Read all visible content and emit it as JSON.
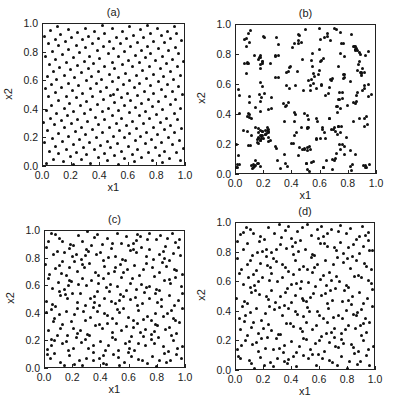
{
  "figure": {
    "panels": [
      {
        "id": "a",
        "title": "(a)",
        "xlabel": "x1",
        "ylabel": "x2",
        "box": {
          "left": 42,
          "top": 23,
          "right": 185,
          "bottom": 166
        },
        "pattern": "uniform-lattice",
        "n": 280,
        "seed": 11
      },
      {
        "id": "b",
        "title": "(b)",
        "xlabel": "x1",
        "ylabel": "x2",
        "box": {
          "left": 235,
          "top": 24,
          "right": 376,
          "bottom": 174
        },
        "pattern": "random-clustered",
        "n": 300,
        "seed": 29
      },
      {
        "id": "c",
        "title": "(c)",
        "xlabel": "x1",
        "ylabel": "x2",
        "box": {
          "left": 44,
          "top": 230,
          "right": 185,
          "bottom": 368
        },
        "pattern": "low-discrepancy",
        "n": 300,
        "seed": 47
      },
      {
        "id": "d",
        "title": "(d)",
        "xlabel": "x1",
        "ylabel": "x2",
        "box": {
          "left": 235,
          "top": 222,
          "right": 375,
          "bottom": 370
        },
        "pattern": "low-discrepancy",
        "n": 300,
        "seed": 83
      }
    ],
    "ticks": [
      "0.0",
      "0.2",
      "0.4",
      "0.6",
      "0.8",
      "1.0"
    ],
    "tick_values": [
      0,
      0.2,
      0.4,
      0.6,
      0.8,
      1.0
    ]
  },
  "chart_data": [
    {
      "type": "scatter",
      "title": "(a)",
      "xlabel": "x1",
      "ylabel": "x2",
      "xlim": [
        0,
        1
      ],
      "ylim": [
        0,
        1
      ],
      "grid": false,
      "legend": null,
      "xticks": [
        "0.0",
        "0.2",
        "0.4",
        "0.6",
        "0.8",
        "1.0"
      ],
      "yticks": [
        "0.0",
        "0.2",
        "0.4",
        "0.6",
        "0.8",
        "1.0"
      ],
      "description": "~280 points, highly uniform space-filling design with a point at the center (0.5,0.5)",
      "series": [
        {
          "name": "design points",
          "x": [
            0.05,
            0.13,
            0.22,
            0.31,
            0.5,
            0.62,
            0.73,
            0.82,
            0.93,
            0.5,
            0.2,
            0.8,
            0.04,
            0.96
          ],
          "y": [
            0.94,
            0.97,
            0.93,
            0.99,
            0.5,
            0.95,
            0.82,
            0.97,
            0.93,
            0.12,
            0.3,
            0.3,
            0.06,
            0.05
          ]
        }
      ]
    },
    {
      "type": "scatter",
      "title": "(b)",
      "xlabel": "x1",
      "ylabel": "x2",
      "xlim": [
        0,
        1
      ],
      "ylim": [
        0,
        1
      ],
      "grid": false,
      "legend": null,
      "xticks": [
        "0.0",
        "0.2",
        "0.4",
        "0.6",
        "0.8",
        "1.0"
      ],
      "yticks": [
        "0.0",
        "0.2",
        "0.4",
        "0.6",
        "0.8",
        "1.0"
      ],
      "description": "~300 points, pure random sampling with visible clusters and gaps",
      "series": [
        {
          "name": "design points",
          "x": [
            0.03,
            0.09,
            0.08,
            0.4,
            0.41,
            0.6,
            0.66,
            0.85,
            0.88,
            0.93,
            0.02,
            0.18
          ],
          "y": [
            0.98,
            0.26,
            0.24,
            0.7,
            0.01,
            0.83,
            0.4,
            0.02,
            0.44,
            0.64,
            0.02,
            0.2
          ]
        }
      ]
    },
    {
      "type": "scatter",
      "title": "(c)",
      "xlabel": "x1",
      "ylabel": "x2",
      "xlim": [
        0,
        1
      ],
      "ylim": [
        0,
        1
      ],
      "grid": false,
      "legend": null,
      "xticks": [
        "0.0",
        "0.2",
        "0.4",
        "0.6",
        "0.8",
        "1.0"
      ],
      "yticks": [
        "0.0",
        "0.2",
        "0.4",
        "0.6",
        "0.8",
        "1.0"
      ],
      "description": "~300 points, quasi-random (low-discrepancy) sequence with diagonal striping",
      "series": [
        {
          "name": "design points",
          "x": [
            0.02,
            0.1,
            0.2,
            0.3,
            0.5,
            0.6,
            0.8,
            0.97,
            0.01,
            0.98
          ],
          "y": [
            0.75,
            0.84,
            0.99,
            0.98,
            0.57,
            0.62,
            0.86,
            0.81,
            0.92,
            0.19
          ]
        }
      ]
    },
    {
      "type": "scatter",
      "title": "(d)",
      "xlabel": "x1",
      "ylabel": "x2",
      "xlim": [
        0,
        1
      ],
      "ylim": [
        0,
        1
      ],
      "grid": false,
      "legend": null,
      "xticks": [
        "0.0",
        "0.2",
        "0.4",
        "0.6",
        "0.8",
        "1.0"
      ],
      "yticks": [
        "0.0",
        "0.2",
        "0.4",
        "0.6",
        "0.8",
        "1.0"
      ],
      "description": "~300 points, quasi-random (low-discrepancy) sequence with diagonal striping",
      "series": [
        {
          "name": "design points",
          "x": [
            0.01,
            0.02,
            0.15,
            0.3,
            0.5,
            0.55,
            0.8,
            0.99,
            0.04,
            0.97
          ],
          "y": [
            0.98,
            0.74,
            0.95,
            0.99,
            0.2,
            0.55,
            0.77,
            0.74,
            0.12,
            0.7
          ]
        }
      ]
    }
  ]
}
